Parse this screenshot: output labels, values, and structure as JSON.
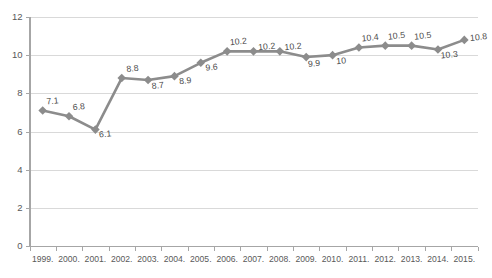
{
  "chart_data": {
    "type": "line",
    "title": "",
    "subtitle": "",
    "xlabel": "",
    "ylabel": "",
    "categories": [
      "1999.",
      "2000.",
      "2001.",
      "2002.",
      "2003.",
      "2004.",
      "2005.",
      "2006.",
      "2007.",
      "2008.",
      "2009.",
      "2010.",
      "2011.",
      "2012.",
      "2013.",
      "2014.",
      "2015."
    ],
    "values": [
      7.1,
      6.8,
      6.1,
      8.8,
      8.7,
      8.9,
      9.6,
      10.2,
      10.2,
      10.2,
      9.9,
      10,
      10.4,
      10.5,
      10.5,
      10.3,
      10.8
    ],
    "point_labels": [
      "7.1",
      "6.8",
      "6.1",
      "8.8",
      "8.7",
      "8.9",
      "9.6",
      "10.2",
      "10.2",
      "10.2",
      "9.9",
      "10",
      "10.4",
      "10.5",
      "10.5",
      "10.3",
      "10.8"
    ],
    "ylim": [
      0,
      12
    ],
    "yticks": [
      0,
      2,
      4,
      6,
      8,
      10,
      12
    ],
    "ytick_labels": [
      "0",
      "2",
      "4",
      "6",
      "8",
      "10",
      "12"
    ],
    "grid": true,
    "grid_axis": "y",
    "legend": false,
    "legend_position": "none",
    "series": [
      {
        "name": "",
        "values": [
          7.1,
          6.8,
          6.1,
          8.8,
          8.7,
          8.9,
          9.6,
          10.2,
          10.2,
          10.2,
          9.9,
          10,
          10.4,
          10.5,
          10.5,
          10.3,
          10.8
        ],
        "color": "#8c8c8c",
        "marker": "diamond"
      }
    ]
  },
  "colors": {
    "series": "#8c8c8c",
    "gridline": "#d9d9d9",
    "axis": "#a6a6a6",
    "tick_text": "#595959",
    "label_text": "#4a4a4a",
    "background": "#ffffff"
  }
}
